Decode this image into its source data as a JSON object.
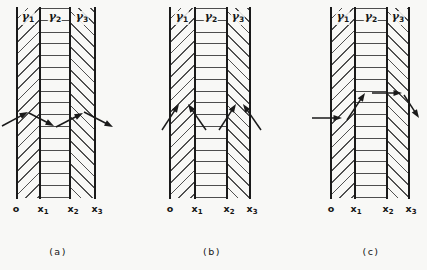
{
  "figure": {
    "background": "#f8f8f6",
    "line_color": "#1a1a1a",
    "hatch_color": "#505050"
  },
  "panels": [
    {
      "caption": "(a)",
      "region_labels": [
        {
          "base": "γ",
          "sub": "1"
        },
        {
          "base": "γ",
          "sub": "2"
        },
        {
          "base": "γ",
          "sub": "3"
        }
      ],
      "axis_labels": [
        {
          "base": "o",
          "sub": ""
        },
        {
          "base": "x",
          "sub": "1"
        },
        {
          "base": "x",
          "sub": "2"
        },
        {
          "base": "x",
          "sub": "3"
        }
      ],
      "arrows": [
        {
          "x1": 2,
          "y1": 126,
          "x2": 28,
          "y2": 112
        },
        {
          "x1": 29,
          "y1": 113,
          "x2": 54,
          "y2": 126
        },
        {
          "x1": 56,
          "y1": 127,
          "x2": 83,
          "y2": 113
        },
        {
          "x1": 84,
          "y1": 112,
          "x2": 113,
          "y2": 127
        }
      ]
    },
    {
      "caption": "(b)",
      "region_labels": [
        {
          "base": "γ",
          "sub": "1"
        },
        {
          "base": "γ",
          "sub": "2"
        },
        {
          "base": "γ",
          "sub": "3"
        }
      ],
      "axis_labels": [
        {
          "base": "o",
          "sub": ""
        },
        {
          "base": "x",
          "sub": "1"
        },
        {
          "base": "x",
          "sub": "2"
        },
        {
          "base": "x",
          "sub": "3"
        }
      ],
      "arrows": [
        {
          "x1": 162,
          "y1": 130,
          "x2": 179,
          "y2": 104
        },
        {
          "x1": 206,
          "y1": 130,
          "x2": 188,
          "y2": 104
        },
        {
          "x1": 219,
          "y1": 130,
          "x2": 236,
          "y2": 104
        },
        {
          "x1": 261,
          "y1": 130,
          "x2": 243,
          "y2": 104
        }
      ]
    },
    {
      "caption": "(c)",
      "region_labels": [
        {
          "base": "γ",
          "sub": "1"
        },
        {
          "base": "γ",
          "sub": "2"
        },
        {
          "base": "γ",
          "sub": "3"
        }
      ],
      "axis_labels": [
        {
          "base": "o",
          "sub": ""
        },
        {
          "base": "x",
          "sub": "1"
        },
        {
          "base": "x",
          "sub": "2"
        },
        {
          "base": "x",
          "sub": "3"
        }
      ],
      "arrows": [
        {
          "x1": 312,
          "y1": 118,
          "x2": 342,
          "y2": 118
        },
        {
          "x1": 347,
          "y1": 120,
          "x2": 365,
          "y2": 93
        },
        {
          "x1": 372,
          "y1": 93,
          "x2": 402,
          "y2": 93
        },
        {
          "x1": 404,
          "y1": 95,
          "x2": 419,
          "y2": 118
        }
      ]
    }
  ]
}
